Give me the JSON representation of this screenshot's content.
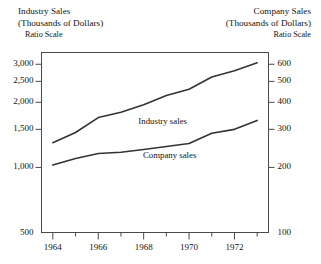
{
  "left_axis_header": {
    "line1": "Industry Sales",
    "line2": "(Thousands of Dollars)",
    "line3": "Ratio Scale"
  },
  "right_axis_header": {
    "line1": "Company Sales",
    "line2": "(Thousands of Dollars)",
    "line3": "Ratio Scale"
  },
  "chart_data": {
    "type": "line",
    "title": "",
    "subtitle": "",
    "xlabel": "",
    "ylabel": "Industry Sales (Thousands of Dollars)",
    "y2label": "Company Sales (Thousands of Dollars)",
    "scale": "log",
    "grid": false,
    "legend": "inline-annotations",
    "xlim": [
      1963.5,
      1973.5
    ],
    "ylim": [
      500,
      3400
    ],
    "y2lim": [
      100,
      680
    ],
    "xticks": [
      1964,
      1965,
      1966,
      1967,
      1968,
      1969,
      1970,
      1971,
      1972,
      1973
    ],
    "xticklabels": [
      "1964",
      "",
      "1966",
      "",
      "1968",
      "",
      "1970",
      "",
      "1972",
      ""
    ],
    "yticks": [
      500,
      1000,
      1500,
      2000,
      2500,
      3000
    ],
    "yticklabels": [
      "500",
      "1,000",
      "1,500",
      "2,000",
      "2,500",
      "3,000"
    ],
    "y2ticks": [
      100,
      200,
      300,
      400,
      500,
      600
    ],
    "y2ticklabels": [
      "100",
      "200",
      "300",
      "400",
      "500",
      "600"
    ],
    "x": [
      1964,
      1965,
      1966,
      1967,
      1968,
      1969,
      1970,
      1971,
      1972,
      1973
    ],
    "series": [
      {
        "name": "Industry sales",
        "axis": "left",
        "label": "Industry sales",
        "label_x": 1969.0,
        "label_y": 1620,
        "values": [
          1300,
          1450,
          1700,
          1800,
          1950,
          2150,
          2300,
          2620,
          2800,
          3050
        ]
      },
      {
        "name": "Company sales",
        "axis": "right",
        "label": "Company sales",
        "label_x": 1969.2,
        "label_y": 225,
        "values": [
          205,
          220,
          232,
          235,
          242,
          250,
          258,
          288,
          300,
          330
        ]
      }
    ]
  }
}
